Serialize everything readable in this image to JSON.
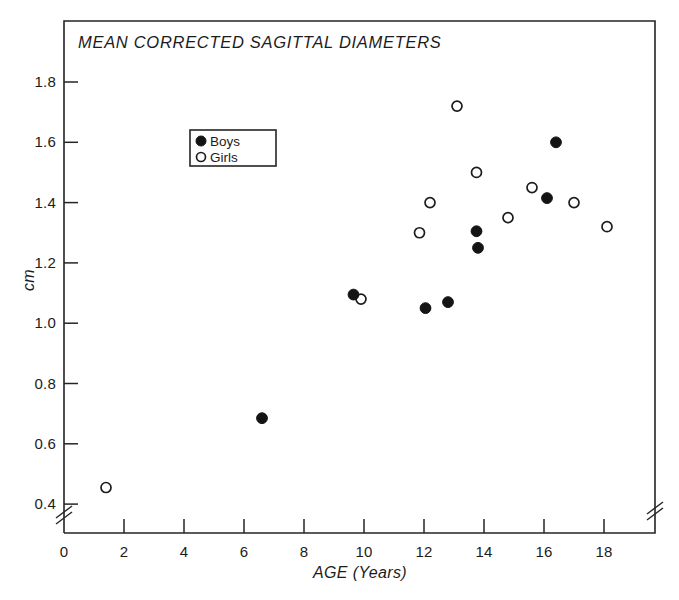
{
  "chart_data": {
    "type": "scatter",
    "title": "MEAN CORRECTED SAGITTAL DIAMETERS",
    "xlabel": "AGE (Years)",
    "ylabel": "cm",
    "xlim": [
      0,
      19
    ],
    "ylim": [
      0.3,
      1.9
    ],
    "xticks": [
      0,
      2,
      4,
      6,
      8,
      10,
      12,
      14,
      16,
      18
    ],
    "xtick_labels": [
      "0",
      "2",
      "4",
      "6",
      "8",
      "10",
      "12",
      "14",
      "16",
      "18"
    ],
    "yticks": [
      0.4,
      0.6,
      0.8,
      1.0,
      1.2,
      1.4,
      1.6,
      1.8
    ],
    "ytick_labels": [
      "0.4",
      "0.6",
      "0.8",
      "1.0",
      "1.2",
      "1.4",
      "1.6",
      "1.8"
    ],
    "grid": false,
    "axis_break_x": true,
    "axis_break_y": true,
    "legend_position": "upper-left-inset",
    "series": [
      {
        "name": "Boys",
        "marker": "filled-circle",
        "color": "#141414",
        "points": [
          {
            "x": 6.6,
            "y": 0.685
          },
          {
            "x": 9.65,
            "y": 1.095
          },
          {
            "x": 12.05,
            "y": 1.05
          },
          {
            "x": 12.8,
            "y": 1.07
          },
          {
            "x": 13.75,
            "y": 1.305
          },
          {
            "x": 13.8,
            "y": 1.25
          },
          {
            "x": 16.4,
            "y": 1.6
          },
          {
            "x": 16.1,
            "y": 1.415
          }
        ]
      },
      {
        "name": "Girls",
        "marker": "open-circle",
        "color": "#ffffff",
        "points": [
          {
            "x": 1.4,
            "y": 0.455
          },
          {
            "x": 9.9,
            "y": 1.08
          },
          {
            "x": 11.85,
            "y": 1.3
          },
          {
            "x": 12.2,
            "y": 1.4
          },
          {
            "x": 13.1,
            "y": 1.72
          },
          {
            "x": 13.75,
            "y": 1.5
          },
          {
            "x": 14.8,
            "y": 1.35
          },
          {
            "x": 15.6,
            "y": 1.45
          },
          {
            "x": 17.0,
            "y": 1.4
          },
          {
            "x": 18.1,
            "y": 1.32
          }
        ]
      }
    ],
    "legend": [
      {
        "label": "Boys",
        "marker": "filled-circle"
      },
      {
        "label": "Girls",
        "marker": "open-circle"
      }
    ]
  }
}
